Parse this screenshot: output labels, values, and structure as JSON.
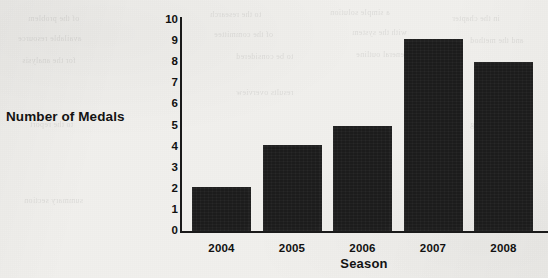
{
  "background": {
    "paper_color": "#f1f0ed",
    "ghost_lines": [
      "of the problem",
      "to the research",
      "a simple solution",
      "in the chapter",
      "available resource",
      "of the committee",
      "with the system",
      "and the method",
      "for the analysis",
      "to be considered",
      "the general outline",
      "to the report",
      "summary section",
      "results overview",
      "further reading"
    ]
  },
  "chart_data": {
    "type": "bar",
    "title": "",
    "xlabel": "Season",
    "ylabel": "Number of Medals",
    "categories": [
      "2004",
      "2005",
      "2006",
      "2007",
      "2008"
    ],
    "values": [
      2.1,
      4.1,
      5.0,
      9.1,
      8.0
    ],
    "ylim": [
      0,
      10
    ],
    "yticks": [
      "10",
      "9",
      "8",
      "7",
      "6",
      "5",
      "4",
      "3",
      "2",
      "1",
      "0"
    ],
    "ytick_values": [
      10,
      9,
      8,
      7,
      6,
      5,
      4,
      3,
      2,
      1,
      0
    ],
    "grid": false,
    "legend": false,
    "bar_color": "#1c1c1c",
    "axis_color": "#1a1a1a",
    "text_color": "#111111"
  }
}
